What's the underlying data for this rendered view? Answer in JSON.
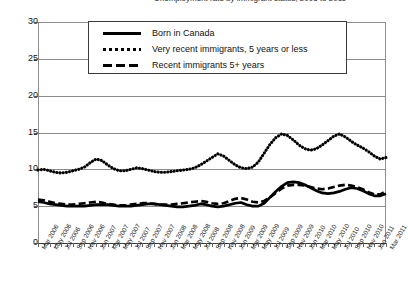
{
  "title_clipped": "Unemployment rate by immigrant status, 2006 to 2011",
  "legend": {
    "items": [
      {
        "label": "Born in Canada",
        "key": "solid-line-key",
        "color": "#000000"
      },
      {
        "label": "Very recent immigrants, 5 years or less",
        "key": "dotted-line-key",
        "color": "#000000"
      },
      {
        "label": "Recent immigrants 5+ years",
        "key": "dashed-line-key",
        "color": "#000000"
      }
    ]
  },
  "axes": {
    "y_ticks": [
      "30",
      "25",
      "20",
      "15",
      "10",
      "5",
      "0"
    ],
    "y_min": 0,
    "y_max": 30,
    "y_step": 5,
    "x_first": "Mar 2006",
    "x_last": "Mar 2011"
  },
  "chart_data": {
    "type": "line",
    "title": "Unemployment rate by immigrant status, 2006 to 2011",
    "xlabel": "",
    "ylabel": "",
    "ylim": [
      0,
      30
    ],
    "ytick_step": 5,
    "grid": true,
    "legend_position": "top-center",
    "x_tick_labels": [
      "Mar 2006",
      "May 2006",
      "Jul 2006",
      "Sep 2006",
      "Nov 2006",
      "Jan 2007",
      "Mar 2007",
      "May 2007",
      "Jul 2007",
      "Sep 2007",
      "Nov 2007",
      "Jan 2008",
      "Mar 2008",
      "May 2008",
      "Jul 2008",
      "Sep 2008",
      "Nov 2008",
      "Jan 2009",
      "Mar 2009",
      "May 2009",
      "Jul 2009",
      "Sep 2009",
      "Nov 2009",
      "Jan 2010",
      "Mar 2010",
      "May 2010",
      "Jul 2010",
      "Sep 2010",
      "Nov 2010",
      "Jan 2011",
      "Mar 2011"
    ],
    "x_points": 61,
    "series": [
      {
        "name": "Born in Canada",
        "style": "solid",
        "color": "#000000",
        "values": [
          5.6,
          5.5,
          5.3,
          5.2,
          5.1,
          5.0,
          5.0,
          5.0,
          5.0,
          5.1,
          5.2,
          5.2,
          5.2,
          5.1,
          5.0,
          5.0,
          5.0,
          5.1,
          5.2,
          5.3,
          5.3,
          5.2,
          5.1,
          5.0,
          4.9,
          4.9,
          5.0,
          5.1,
          5.3,
          5.2,
          5.0,
          4.9,
          5.0,
          5.2,
          5.4,
          5.5,
          5.2,
          5.0,
          5.0,
          5.4,
          6.2,
          7.0,
          7.7,
          8.2,
          8.3,
          8.2,
          7.9,
          7.5,
          7.1,
          6.8,
          6.7,
          6.8,
          7.0,
          7.3,
          7.5,
          7.4,
          7.1,
          6.7,
          6.4,
          6.4,
          6.7
        ]
      },
      {
        "name": "Very recent immigrants, 5 years or less",
        "style": "dotted",
        "color": "#000000",
        "values": [
          9.9,
          10.0,
          9.8,
          9.6,
          9.5,
          9.6,
          9.8,
          10.0,
          10.3,
          10.9,
          11.4,
          11.2,
          10.6,
          10.1,
          9.8,
          9.8,
          10.0,
          10.2,
          10.1,
          9.9,
          9.7,
          9.6,
          9.6,
          9.7,
          9.8,
          9.9,
          10.0,
          10.2,
          10.6,
          11.1,
          11.6,
          12.1,
          11.8,
          11.2,
          10.6,
          10.2,
          10.1,
          10.3,
          11.0,
          12.2,
          13.4,
          14.3,
          14.8,
          14.6,
          14.0,
          13.3,
          12.8,
          12.6,
          12.8,
          13.3,
          13.9,
          14.5,
          14.8,
          14.4,
          13.8,
          13.3,
          12.9,
          12.4,
          11.8,
          11.4,
          11.6
        ]
      },
      {
        "name": "Recent immigrants 5+ years",
        "style": "dashed",
        "color": "#000000",
        "values": [
          5.9,
          5.8,
          5.6,
          5.4,
          5.3,
          5.2,
          5.2,
          5.3,
          5.4,
          5.5,
          5.6,
          5.5,
          5.3,
          5.2,
          5.1,
          5.1,
          5.2,
          5.3,
          5.4,
          5.4,
          5.3,
          5.2,
          5.2,
          5.2,
          5.3,
          5.4,
          5.5,
          5.6,
          5.7,
          5.6,
          5.4,
          5.3,
          5.4,
          5.7,
          6.0,
          6.1,
          5.9,
          5.6,
          5.5,
          5.7,
          6.2,
          6.8,
          7.4,
          7.8,
          7.9,
          7.9,
          7.8,
          7.6,
          7.4,
          7.3,
          7.4,
          7.6,
          7.8,
          7.9,
          7.8,
          7.6,
          7.3,
          6.9,
          6.6,
          6.6,
          7.0
        ]
      }
    ]
  }
}
